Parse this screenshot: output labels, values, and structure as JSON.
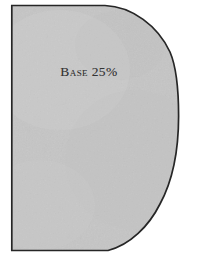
{
  "figure": {
    "title": "Base 25%",
    "shape_label": "Base 25%",
    "shape_name": "d-shape-region",
    "colors": {
      "fill": "#c5c5c5",
      "fill_light": "#cdcdcd",
      "fill_dark": "#b9b9b9",
      "stroke": "#262626",
      "background": "#ffffff",
      "label_text": "#343434"
    },
    "geometry": {
      "canvas_width": 202,
      "canvas_height": 260,
      "left_edge_x": 11,
      "top_edge_y": 5,
      "bottom_edge_y": 251,
      "right_extent_x": 178,
      "top_flat_end_x": 105,
      "bottom_flat_end_x": 108,
      "stroke_width": 1.6,
      "description": "Flat left, top and bottom edges with a large convex arc bulging to the right"
    },
    "label_position": {
      "center_x": 89,
      "baseline_y": 78
    }
  }
}
